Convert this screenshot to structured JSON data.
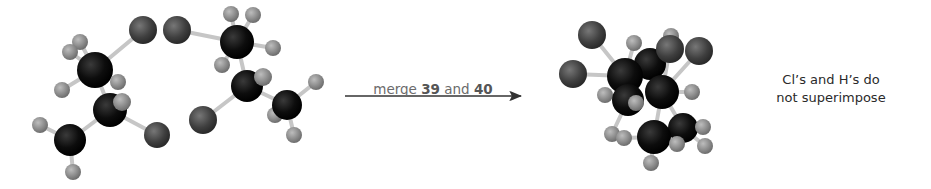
{
  "reaction": {
    "arrow_label": {
      "prefix": "merge ",
      "first_compound": "39",
      "conjunction": " and ",
      "second_compound": "40"
    },
    "note_line1": "Cl’s and H’s do",
    "note_line2": "not superimpose"
  },
  "colors": {
    "carbon": "#111111",
    "chlorine": "#444444",
    "hydrogen": "#8a8a8a",
    "bond": "#c8c8c8",
    "arrow": "#333333",
    "label_gray": "#6b6b6b",
    "text": "#2a2a2a"
  },
  "molecules": {
    "compound_39": {
      "label": "39",
      "atoms": [
        "Cl",
        "C",
        "C",
        "C",
        "Cl",
        "H",
        "H",
        "H",
        "H",
        "H",
        "H",
        "H",
        "H"
      ]
    },
    "compound_40": {
      "label": "40",
      "atoms": [
        "Cl",
        "C",
        "C",
        "C",
        "Cl",
        "H",
        "H",
        "H",
        "H",
        "H",
        "H",
        "H",
        "H"
      ]
    },
    "merged": {
      "label": "merged 39 + 40"
    }
  }
}
